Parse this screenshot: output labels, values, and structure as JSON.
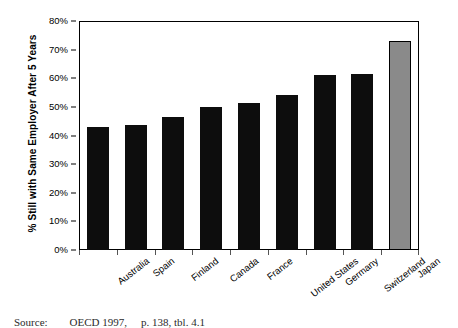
{
  "chart_data": {
    "type": "bar",
    "title": "",
    "xlabel": "",
    "ylabel": "% Still with Same Employer After 5 Years",
    "ylim": [
      0,
      80
    ],
    "ytick_labels": [
      "80%",
      "70%",
      "60%",
      "50%",
      "40%",
      "30%",
      "20%",
      "10%",
      "0%"
    ],
    "ytick_values": [
      80,
      70,
      60,
      50,
      40,
      30,
      20,
      10,
      0
    ],
    "grid": false,
    "legend": "none",
    "categories": [
      "Australia",
      "Spain",
      "Finland",
      "Canada",
      "France",
      "United States",
      "Germany",
      "Switzerland",
      "Japan"
    ],
    "values": [
      43,
      43.5,
      46.5,
      50,
      51.5,
      54,
      61,
      61.5,
      73
    ],
    "series": [
      {
        "name": "% Still with Same Employer After 5 Years",
        "values": [
          43,
          43.5,
          46.5,
          50,
          51.5,
          54,
          61,
          61.5,
          73
        ]
      }
    ],
    "bar_colors": [
      "#0d0d0d",
      "#0d0d0d",
      "#0d0d0d",
      "#0d0d0d",
      "#0d0d0d",
      "#0d0d0d",
      "#0d0d0d",
      "#0d0d0d",
      "#8a8a8a"
    ],
    "highlight_category": "Japan",
    "highlight_color": "#8a8a8a",
    "bar_color": "#0d0d0d"
  },
  "footer": {
    "source_label": "Source:",
    "source_text": "OECD 1997,",
    "source_page": "p. 138, tbl. 4.1"
  }
}
